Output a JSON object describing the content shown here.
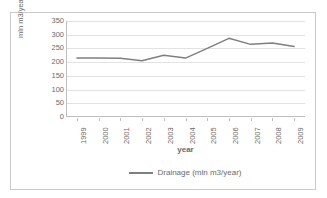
{
  "chart_data": {
    "type": "line",
    "title": "",
    "xlabel": "year",
    "ylabel": "mln m3/year",
    "categories": [
      "1999",
      "2000",
      "2001",
      "2002",
      "2003",
      "2004",
      "2005",
      "2006",
      "2007",
      "2008",
      "2009"
    ],
    "series": [
      {
        "name": "Drainage (mln m3/year)",
        "color": "#7f7f7f",
        "values": [
          215,
          215,
          214,
          205,
          225,
          215,
          250,
          287,
          265,
          270,
          257
        ]
      }
    ],
    "ylim": [
      0,
      350
    ],
    "yticks": [
      0,
      50,
      100,
      150,
      200,
      250,
      300,
      350
    ],
    "ytick_labels": [
      "0",
      "50",
      "100",
      "150",
      "200",
      "250",
      "300",
      "350"
    ],
    "grid": true,
    "legend_position": "bottom"
  },
  "axes": {
    "y_title": "mln m3/year",
    "x_title": "year"
  },
  "legend": {
    "entries": [
      {
        "label": "Drainage (mln m3/year)",
        "color": "#7f7f7f"
      }
    ]
  },
  "colors": {
    "series": "#7f7f7f",
    "grid": "#e2e2e2",
    "axis": "#bfbfbf",
    "border": "#c9c9c9",
    "text": "#6b6b6b"
  }
}
